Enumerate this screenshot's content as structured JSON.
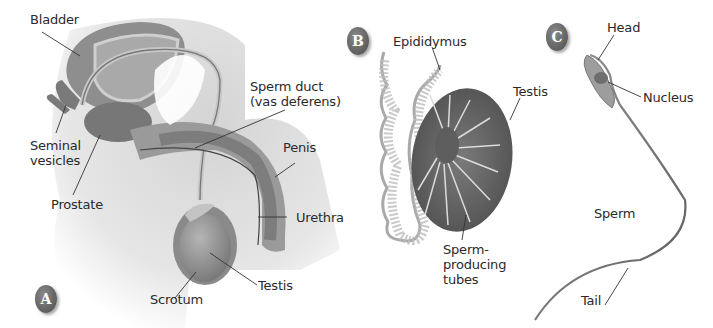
{
  "panels": {
    "a": {
      "badge": "A",
      "title": "Male reproductive system",
      "labels": {
        "bladder": "Bladder",
        "seminal_vesicles": "Seminal\nvesicles",
        "prostate": "Prostate",
        "sperm_duct": "Sperm duct\n(vas deferens)",
        "penis": "Penis",
        "urethra": "Urethra",
        "testis": "Testis",
        "scrotum": "Scrotum"
      }
    },
    "b": {
      "badge": "B",
      "title": "Testis cross-section",
      "labels": {
        "epididymus": "Epididymus",
        "testis": "Testis",
        "tubes": "Sperm-\nproducing\ntubes"
      }
    },
    "c": {
      "badge": "C",
      "title": "Sperm cell",
      "labels": {
        "head": "Head",
        "nucleus": "Nucleus",
        "sperm": "Sperm",
        "tail": "Tail"
      }
    }
  },
  "colors": {
    "background": "#ffffff",
    "body_shade": "#d8d8d8",
    "organ_mid": "#8c8c8c",
    "organ_dark": "#6a6a6a",
    "badge": "#6a6a6a",
    "text": "#2a2a2a"
  }
}
